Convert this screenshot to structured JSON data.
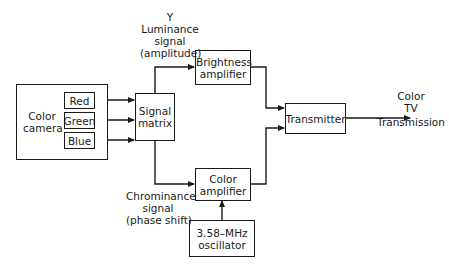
{
  "diagram": {
    "type": "block-diagram",
    "nodes": {
      "camera": "Color camera",
      "red": "Red",
      "green": "Green",
      "blue": "Blue",
      "matrix": "Signal matrix",
      "brightness": "Brightness amplifier",
      "color_amp": "Color amplifier",
      "oscillator": "3.58–MHz oscillator",
      "transmitter": "Transmitter"
    },
    "labels": {
      "y_line1": "Y",
      "y_line2": "Luminance",
      "y_line3": "signal",
      "y_line4": "(amplitude)",
      "c_line1": "Chrominance",
      "c_line2": "signal",
      "c_line3": "(phase shift)",
      "out_line1": "Color",
      "out_line2": "TV",
      "out_line3": "Transmission"
    },
    "edges": [
      {
        "from": "Red",
        "to": "Signal matrix"
      },
      {
        "from": "Green",
        "to": "Signal matrix"
      },
      {
        "from": "Blue",
        "to": "Signal matrix"
      },
      {
        "from": "Signal matrix",
        "to": "Brightness amplifier",
        "label": "Y Luminance signal (amplitude)"
      },
      {
        "from": "Signal matrix",
        "to": "Color amplifier",
        "label": "Chrominance signal (phase shift)"
      },
      {
        "from": "3.58–MHz oscillator",
        "to": "Color amplifier"
      },
      {
        "from": "Brightness amplifier",
        "to": "Transmitter"
      },
      {
        "from": "Color amplifier",
        "to": "Transmitter"
      },
      {
        "from": "Transmitter",
        "to": "output",
        "label": "Color TV Transmission"
      }
    ]
  }
}
